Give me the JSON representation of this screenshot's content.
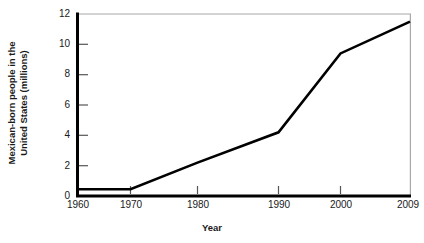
{
  "chart_data": {
    "type": "line",
    "title": "",
    "subtitle": "",
    "xlabel": "Year",
    "ylabel": "Mexican-born people in the United States (millions)",
    "ylabel_line1": "Mexican-born people in the",
    "ylabel_line2": "United States (millions)",
    "x": [
      1960,
      1970,
      1980,
      1990,
      2000,
      2009
    ],
    "values": [
      0.45,
      0.45,
      2.2,
      4.2,
      9.4,
      11.5
    ],
    "series": [
      {
        "name": "Mexican-born people in the United States (millions)",
        "values": [
          0.45,
          0.45,
          2.2,
          4.2,
          9.4,
          11.5
        ]
      }
    ],
    "xtick_labels": [
      "1960",
      "1970",
      "1980",
      "1990",
      "2000",
      "2009"
    ],
    "ytick_labels": [
      "0",
      "2",
      "4",
      "6",
      "8",
      "10",
      "12"
    ],
    "ytick_values": [
      0,
      2,
      4,
      6,
      8,
      10,
      12
    ],
    "xlim": [
      1960,
      2009
    ],
    "ylim": [
      0,
      12
    ],
    "grid": false,
    "legend": "none",
    "line_color": "#000000",
    "axis_color": "#000000",
    "frame_color": "#a8a8a8",
    "text_color": "#1a1a1a",
    "background": "#ffffff",
    "annotations": []
  }
}
